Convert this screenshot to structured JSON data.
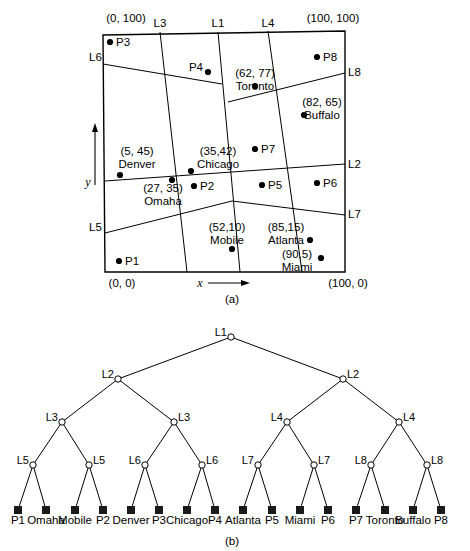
{
  "figure": {
    "panel_a_label": "(a)",
    "panel_b_label": "(b)"
  },
  "map": {
    "corner_labels": {
      "top_left": "(0, 100)",
      "top_right": "(100, 100)",
      "bottom_left": "(0, 0)",
      "bottom_right": "(100, 0)"
    },
    "axis_labels": {
      "x": "x",
      "y": "y"
    },
    "boundary": {
      "top_left": [
        103,
        35
      ],
      "top_right": [
        345,
        31
      ],
      "bottom_right": [
        345,
        272
      ],
      "bottom_left": [
        105,
        272
      ]
    },
    "partition_line_labels": [
      {
        "name": "L3",
        "x": 160,
        "y": 27,
        "anchor": "middle"
      },
      {
        "name": "L1",
        "x": 218,
        "y": 27,
        "anchor": "middle"
      },
      {
        "name": "L4",
        "x": 268,
        "y": 27,
        "anchor": "middle"
      },
      {
        "name": "L6",
        "x": 89,
        "y": 61,
        "anchor": "start"
      },
      {
        "name": "L8",
        "x": 348,
        "y": 76,
        "anchor": "start"
      },
      {
        "name": "L2",
        "x": 348,
        "y": 168,
        "anchor": "start"
      },
      {
        "name": "L7",
        "x": 348,
        "y": 218,
        "anchor": "start"
      },
      {
        "name": "L5",
        "x": 89,
        "y": 231,
        "anchor": "start"
      }
    ],
    "partition_lines": [
      {
        "name": "L1",
        "x1": 218,
        "y1": 32,
        "x2": 240,
        "y2": 272
      },
      {
        "name": "L3",
        "x1": 160,
        "y1": 32,
        "x2": 187,
        "y2": 272
      },
      {
        "name": "L4",
        "x1": 268,
        "y1": 31,
        "x2": 302,
        "y2": 272
      },
      {
        "name": "L6",
        "x1": 103,
        "y1": 64,
        "x2": 222,
        "y2": 84
      },
      {
        "name": "L8",
        "x1": 228,
        "y1": 102,
        "x2": 345,
        "y2": 73
      },
      {
        "name": "L2",
        "x1": 105,
        "y1": 181,
        "x2": 345,
        "y2": 164
      },
      {
        "name": "L5",
        "x1": 105,
        "y1": 233,
        "x2": 232,
        "y2": 201
      },
      {
        "name": "L7",
        "x1": 232,
        "y1": 201,
        "x2": 345,
        "y2": 215
      }
    ],
    "cities": [
      {
        "label": "P3",
        "coord": "",
        "dot": [
          110,
          42
        ],
        "label_x": 116,
        "label_y": 46,
        "anchor": "start",
        "type": "point"
      },
      {
        "label": "P4",
        "coord": "",
        "dot": [
          208,
          72
        ],
        "label_x": 203,
        "label_y": 71,
        "anchor": "end",
        "type": "point"
      },
      {
        "label": "P8",
        "coord": "",
        "dot": [
          317,
          57
        ],
        "label_x": 323,
        "label_y": 61,
        "anchor": "start",
        "type": "point"
      },
      {
        "label": "Toronto",
        "coord": "(62, 77)",
        "dot": [
          255,
          86
        ],
        "label_x": 255,
        "label_y": 77,
        "anchor": "middle",
        "type": "city"
      },
      {
        "label": "Buffalo",
        "coord": "(82, 65)",
        "dot": [
          304,
          115
        ],
        "label_x": 322,
        "label_y": 106,
        "anchor": "middle",
        "type": "city"
      },
      {
        "label": "Denver",
        "coord": "(5, 45)",
        "dot": [
          120,
          175
        ],
        "label_x": 137,
        "label_y": 155,
        "anchor": "middle",
        "type": "city"
      },
      {
        "label": "Chicago",
        "coord": "(35,42)",
        "dot": [
          191,
          171
        ],
        "label_x": 218,
        "label_y": 155,
        "anchor": "middle",
        "type": "city"
      },
      {
        "label": "P7",
        "coord": "",
        "dot": [
          255,
          149
        ],
        "label_x": 261,
        "label_y": 153,
        "anchor": "start",
        "type": "point"
      },
      {
        "label": "Omaha",
        "coord": "(27, 35)",
        "dot": [
          172,
          180
        ],
        "label_x": 163,
        "label_y": 192,
        "anchor": "middle",
        "type": "city"
      },
      {
        "label": "P2",
        "coord": "",
        "dot": [
          194,
          186
        ],
        "label_x": 200,
        "label_y": 190,
        "anchor": "start",
        "type": "point"
      },
      {
        "label": "P5",
        "coord": "",
        "dot": [
          262,
          185
        ],
        "label_x": 268,
        "label_y": 189,
        "anchor": "start",
        "type": "point"
      },
      {
        "label": "P6",
        "coord": "",
        "dot": [
          317,
          183
        ],
        "label_x": 323,
        "label_y": 187,
        "anchor": "start",
        "type": "point"
      },
      {
        "label": "Mobile",
        "coord": "(52,10)",
        "dot": [
          232,
          249
        ],
        "label_x": 227,
        "label_y": 231,
        "anchor": "middle",
        "type": "city"
      },
      {
        "label": "Atlanta",
        "coord": "(85,15)",
        "dot": [
          310,
          240
        ],
        "label_x": 286,
        "label_y": 231,
        "anchor": "middle",
        "type": "city"
      },
      {
        "label": "Miami",
        "coord": "(90,5)",
        "dot": [
          321,
          258
        ],
        "label_x": 297,
        "label_y": 258,
        "anchor": "middle",
        "type": "city"
      },
      {
        "label": "P1",
        "coord": "",
        "dot": [
          119,
          261
        ],
        "label_x": 125,
        "label_y": 265,
        "anchor": "start",
        "type": "point"
      }
    ]
  },
  "tree": {
    "levels": [
      {
        "level": 1,
        "y": 337,
        "nodes": [
          {
            "label": "L1",
            "x": 231,
            "side": "left"
          }
        ]
      },
      {
        "level": 2,
        "y": 379,
        "nodes": [
          {
            "label": "L2",
            "x": 118,
            "side": "left"
          },
          {
            "label": "L2",
            "x": 343,
            "side": "right"
          }
        ]
      },
      {
        "level": 3,
        "y": 422,
        "nodes": [
          {
            "label": "L3",
            "x": 62,
            "side": "left"
          },
          {
            "label": "L3",
            "x": 174,
            "side": "right"
          },
          {
            "label": "L4",
            "x": 287,
            "side": "left"
          },
          {
            "label": "L4",
            "x": 399,
            "side": "right"
          }
        ]
      },
      {
        "level": 4,
        "y": 465,
        "nodes": [
          {
            "label": "L5",
            "x": 33,
            "side": "left"
          },
          {
            "label": "L5",
            "x": 89,
            "side": "right"
          },
          {
            "label": "L6",
            "x": 145,
            "side": "left"
          },
          {
            "label": "L6",
            "x": 202,
            "side": "right"
          },
          {
            "label": "L7",
            "x": 258,
            "side": "left"
          },
          {
            "label": "L7",
            "x": 314,
            "side": "right"
          },
          {
            "label": "L8",
            "x": 371,
            "side": "left"
          },
          {
            "label": "L8",
            "x": 427,
            "side": "right"
          }
        ]
      }
    ],
    "leaves": [
      {
        "label": "P1",
        "x": 18,
        "y": 510
      },
      {
        "label": "Omaha",
        "x": 46,
        "y": 510
      },
      {
        "label": "Mobile",
        "x": 75,
        "y": 510
      },
      {
        "label": "P2",
        "x": 103,
        "y": 510
      },
      {
        "label": "Denver",
        "x": 131,
        "y": 510
      },
      {
        "label": "P3",
        "x": 159,
        "y": 510
      },
      {
        "label": "Chicago",
        "x": 187,
        "y": 510
      },
      {
        "label": "P4",
        "x": 215,
        "y": 510
      },
      {
        "label": "Atlanta",
        "x": 243,
        "y": 510
      },
      {
        "label": "P5",
        "x": 272,
        "y": 510
      },
      {
        "label": "Miami",
        "x": 300,
        "y": 510
      },
      {
        "label": "P6",
        "x": 328,
        "y": 510
      },
      {
        "label": "P7",
        "x": 356,
        "y": 510
      },
      {
        "label": "Toronto",
        "x": 385,
        "y": 510
      },
      {
        "label": "Buffalo",
        "x": 413,
        "y": 510
      },
      {
        "label": "P8",
        "x": 441,
        "y": 510
      }
    ],
    "leaf_label_y": 524
  },
  "colors": {
    "line": "#000000",
    "node_fill": "#ffffff",
    "leaf_fill": "#1a1a1a",
    "background": "#ffffff"
  }
}
